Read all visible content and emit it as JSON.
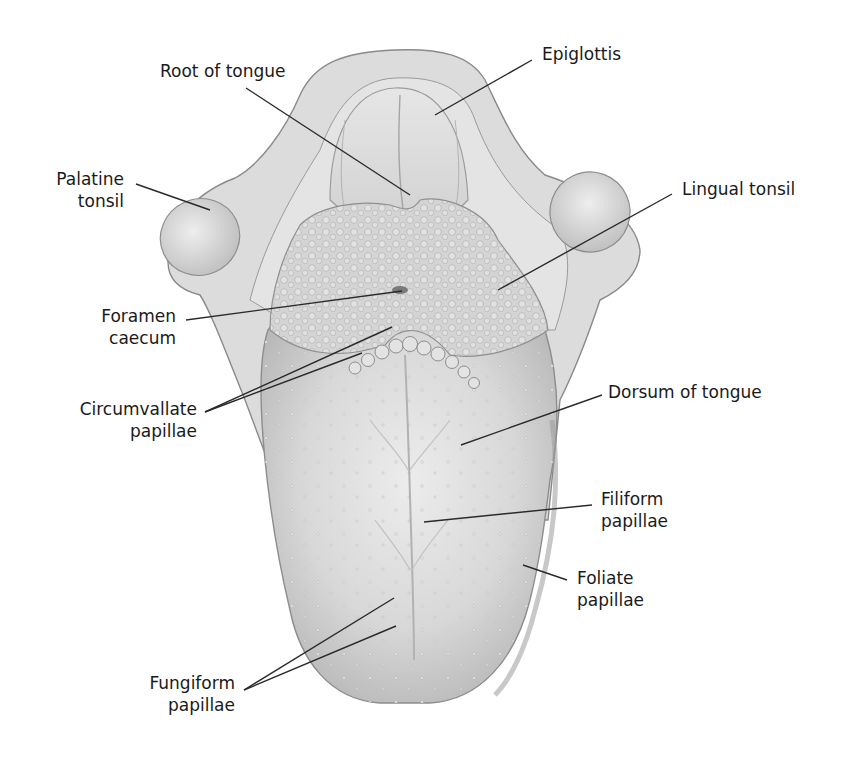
{
  "figure": {
    "colors": {
      "background": "#ffffff",
      "tissue_light": "#e8e8e8",
      "tissue_mid": "#cfcfcf",
      "tissue_dark": "#a8a8a8",
      "outline": "#8a8a8a",
      "leader_line": "#2a2a2a",
      "text": "#1a1a1a"
    }
  },
  "labels": {
    "root_of_tongue": {
      "line1": "Root of tongue"
    },
    "epiglottis": {
      "line1": "Epiglottis"
    },
    "palatine_tonsil": {
      "line1": "Palatine",
      "line2": "tonsil"
    },
    "lingual_tonsil": {
      "line1": "Lingual tonsil"
    },
    "foramen_caecum": {
      "line1": "Foramen",
      "line2": "caecum"
    },
    "circumvallate_papillae": {
      "line1": "Circumvallate",
      "line2": "papillae"
    },
    "dorsum_of_tongue": {
      "line1": "Dorsum of tongue"
    },
    "filiform_papillae": {
      "line1": "Filiform",
      "line2": "papillae"
    },
    "foliate_papillae": {
      "line1": "Foliate",
      "line2": "papillae"
    },
    "fungiform_papillae": {
      "line1": "Fungiform",
      "line2": "papillae"
    }
  }
}
